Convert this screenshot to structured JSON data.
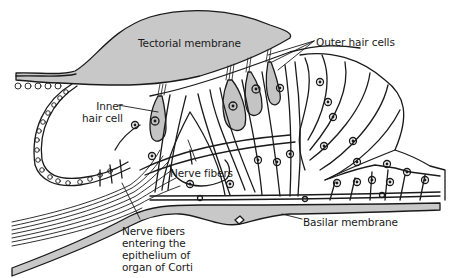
{
  "diagram": {
    "colors": {
      "line": "#1a1a1a",
      "membrane_fill": "#c8c8c8",
      "hair_cell_fill": "#c4c4c4",
      "background": "#ffffff"
    },
    "labels": {
      "tectorial_membrane": "Tectorial membrane",
      "outer_hair_cells": "Outer hair cells",
      "inner_hair_cell_line1": "Inner",
      "inner_hair_cell_line2": "hair cell",
      "nerve_fibers": "Nerve fibers",
      "basilar_membrane": "Basilar membrane",
      "nerve_fibers_entering_line1": "Nerve fibers",
      "nerve_fibers_entering_line2": "entering the",
      "nerve_fibers_entering_line3": "epithelium of",
      "nerve_fibers_entering_line4": "organ of Corti"
    }
  }
}
